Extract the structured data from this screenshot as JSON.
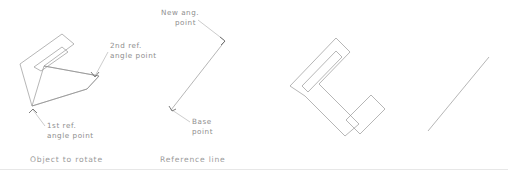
{
  "figure": {
    "background_color": "#ffffff",
    "stroke_color": "#8e8e8e",
    "text_color": "#8d8d8d",
    "leader_color": "#a2a2a2",
    "rule_color": "#dcdcdc"
  },
  "panels": {
    "object_to_rotate": {
      "caption": "Object to rotate",
      "caption_x": 30,
      "caption_y": 162,
      "annotations": [
        {
          "key": "second_ref",
          "line1": "2nd ref.",
          "line2": "angle point",
          "text_x": 110,
          "text_y1": 48,
          "text_y2": 58,
          "leader": "M 108 52 L 95 76",
          "arrow": "M 91 72 L 95 77 L 99 72"
        },
        {
          "key": "first_ref",
          "line1": "1st ref.",
          "line2": "angle point",
          "text_x": 47,
          "text_y1": 128,
          "text_y2": 138,
          "leader": "M 45 126 L 33 110",
          "arrow": "M 29 113 L 33 109 L 37 113"
        }
      ],
      "shapes": {
        "outer_c": "M 20 64 L 62 34 L 74 44 L 44 66 L 99 76 L 87 89 L 32 106 Z",
        "inner_notch": "M 34 67 L 62 47 L 68 52 L 41 71 Z",
        "mid_band": "M 44 66 L 99 76 L 87 89 L 32 106 Z"
      }
    },
    "reference_line": {
      "caption": "Reference line",
      "caption_x": 160,
      "caption_y": 162,
      "annotations": [
        {
          "key": "new_angle",
          "line1": "New ang.",
          "line2": "point",
          "text_x": 161,
          "text_y1": 15,
          "text_y2": 25,
          "leader": "M 198 20 L 224 40",
          "arrow": "M 220 37 L 225 41 L 221 45"
        },
        {
          "key": "base_point",
          "line1": "Base",
          "line2": "point",
          "text_x": 192,
          "text_y1": 124,
          "text_y2": 134,
          "leader": "M 190 122 L 172 110",
          "arrow": "M 169 106 L 172 111 L 176 109"
        }
      ],
      "shapes": {
        "bend": "M 225 41 L 171 110"
      }
    },
    "rotated_object": {
      "caption": "",
      "shapes": {
        "outer_c": "M 290 86 L 336 38 L 350 52 L 319 84 L 359 124 L 345 136 L 305 96 Z",
        "inner_notch": "M 302 86 L 336 51 L 342 57 L 308 92 Z",
        "outer_arm": "M 346 120 L 371 95 L 385 109 L 360 134 Z"
      }
    },
    "result_line": {
      "caption": "",
      "shapes": {
        "diagonal": "M 428 131 L 489 57"
      }
    }
  }
}
